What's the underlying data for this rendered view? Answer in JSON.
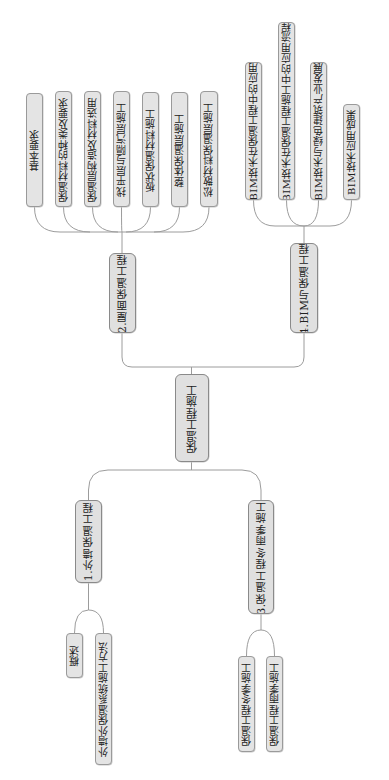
{
  "diagram": {
    "center": {
      "label": "保温工程施工"
    },
    "branches": [
      {
        "label": "1.外墙保温工程",
        "children": [
          {
            "label": "概述"
          },
          {
            "label": "外墙外保温系统施工方法"
          }
        ]
      },
      {
        "label": "2.屋面保温工程",
        "children": [
          {
            "label": "基本要求"
          },
          {
            "label": "保温材料的种类及要求"
          },
          {
            "label": "保温层构造及材料选用"
          },
          {
            "label": "找平层与隔汽层施工"
          },
          {
            "label": "板状保温材料施工"
          },
          {
            "label": "整体保温层施工"
          },
          {
            "label": "松散材料保温层施工"
          }
        ]
      },
      {
        "label": "3.保温工程冬雨季施工",
        "children": [
          {
            "label": "保温工程冬季施工"
          },
          {
            "label": "保温工程雨季施工"
          }
        ]
      },
      {
        "label": "4.BIM与保温工程",
        "children": [
          {
            "label": "BIM技术在保温工程中的应用"
          },
          {
            "label": "BIM技术在保温工程施工中的应用流程"
          },
          {
            "label": "BIM技术与绿色建筑产业发展"
          },
          {
            "label": "BIM技术应用成果"
          }
        ]
      }
    ],
    "colors": {
      "node_fill": "#e4e4e4",
      "node_border": "#9a9a9a",
      "line": "#9c9c9c",
      "text": "#222222"
    }
  }
}
